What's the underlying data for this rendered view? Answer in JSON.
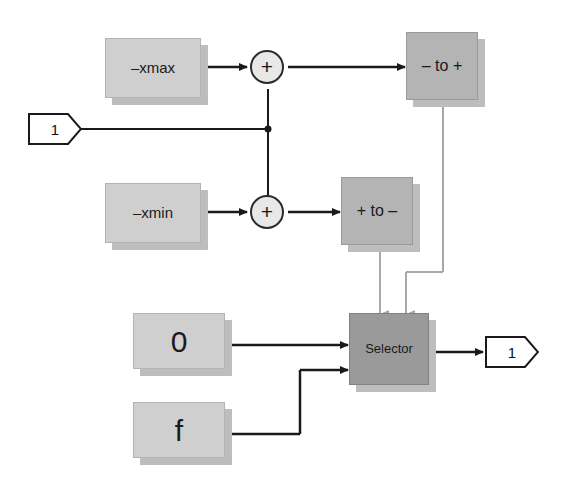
{
  "diagram": {
    "colors": {
      "block_light": "#cfcfcf",
      "block_mid": "#b4b4b4",
      "block_dark": "#9a9a9a",
      "shadow": "#bdbdbd",
      "wire": "#1a1a1a",
      "wire_grey": "#a8a8a8",
      "background": "#ffffff"
    },
    "blocks": [
      {
        "id": "xmax",
        "label": "–xmax",
        "shade": "light"
      },
      {
        "id": "xmin",
        "label": "–xmin",
        "shade": "light"
      },
      {
        "id": "neg_to_pos",
        "label": "– to +",
        "shade": "mid"
      },
      {
        "id": "pos_to_neg",
        "label": "+ to –",
        "shade": "mid"
      },
      {
        "id": "zero",
        "label": "0",
        "shade": "light"
      },
      {
        "id": "f",
        "label": "f",
        "shade": "light"
      },
      {
        "id": "selector",
        "label": "Selector",
        "shade": "dark"
      }
    ],
    "sums": [
      {
        "id": "sum-top",
        "label": "+"
      },
      {
        "id": "sum-bottom",
        "label": "+"
      }
    ],
    "ports": [
      {
        "id": "input-1",
        "label": "1",
        "kind": "input"
      },
      {
        "id": "output-1",
        "label": "1",
        "kind": "output"
      }
    ]
  }
}
